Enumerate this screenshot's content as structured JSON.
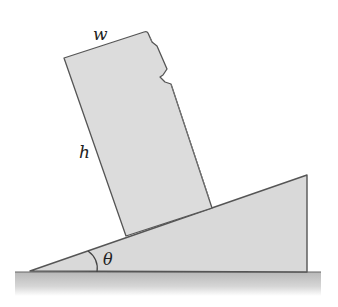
{
  "diagram": {
    "labels": {
      "width": "w",
      "height": "h",
      "angle": "θ"
    },
    "colors": {
      "fill": "#d9d9d9",
      "stroke": "#555555",
      "ground": "#c4c4c4",
      "background": "#ffffff"
    }
  }
}
